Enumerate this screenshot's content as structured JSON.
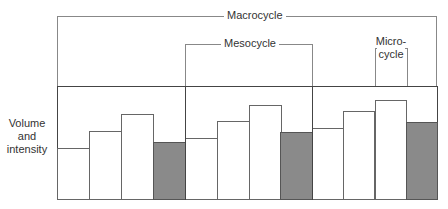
{
  "diagram": {
    "y_axis_label": [
      "Volume",
      "and",
      "intensity"
    ],
    "brackets": {
      "macrocycle": {
        "label": "Macrocycle"
      },
      "mesocycle": {
        "label": "Mesocycle"
      },
      "microcycle": {
        "label_line1": "Micro-",
        "label_line2": "cycle"
      }
    },
    "colors": {
      "load_bar": "#ffffff",
      "recovery_bar": "#8a8a8a",
      "lines": "#444444"
    },
    "mesocycles": [
      {
        "microcycles": [
          {
            "relative_height": 0.45,
            "type": "load"
          },
          {
            "relative_height": 0.6,
            "type": "load"
          },
          {
            "relative_height": 0.75,
            "type": "load"
          },
          {
            "relative_height": 0.5,
            "type": "recovery"
          }
        ]
      },
      {
        "microcycles": [
          {
            "relative_height": 0.54,
            "type": "load"
          },
          {
            "relative_height": 0.69,
            "type": "load"
          },
          {
            "relative_height": 0.83,
            "type": "load"
          },
          {
            "relative_height": 0.59,
            "type": "recovery"
          }
        ]
      },
      {
        "microcycles": [
          {
            "relative_height": 0.63,
            "type": "load"
          },
          {
            "relative_height": 0.78,
            "type": "load"
          },
          {
            "relative_height": 0.88,
            "type": "load"
          },
          {
            "relative_height": 0.68,
            "type": "recovery"
          }
        ]
      }
    ]
  }
}
